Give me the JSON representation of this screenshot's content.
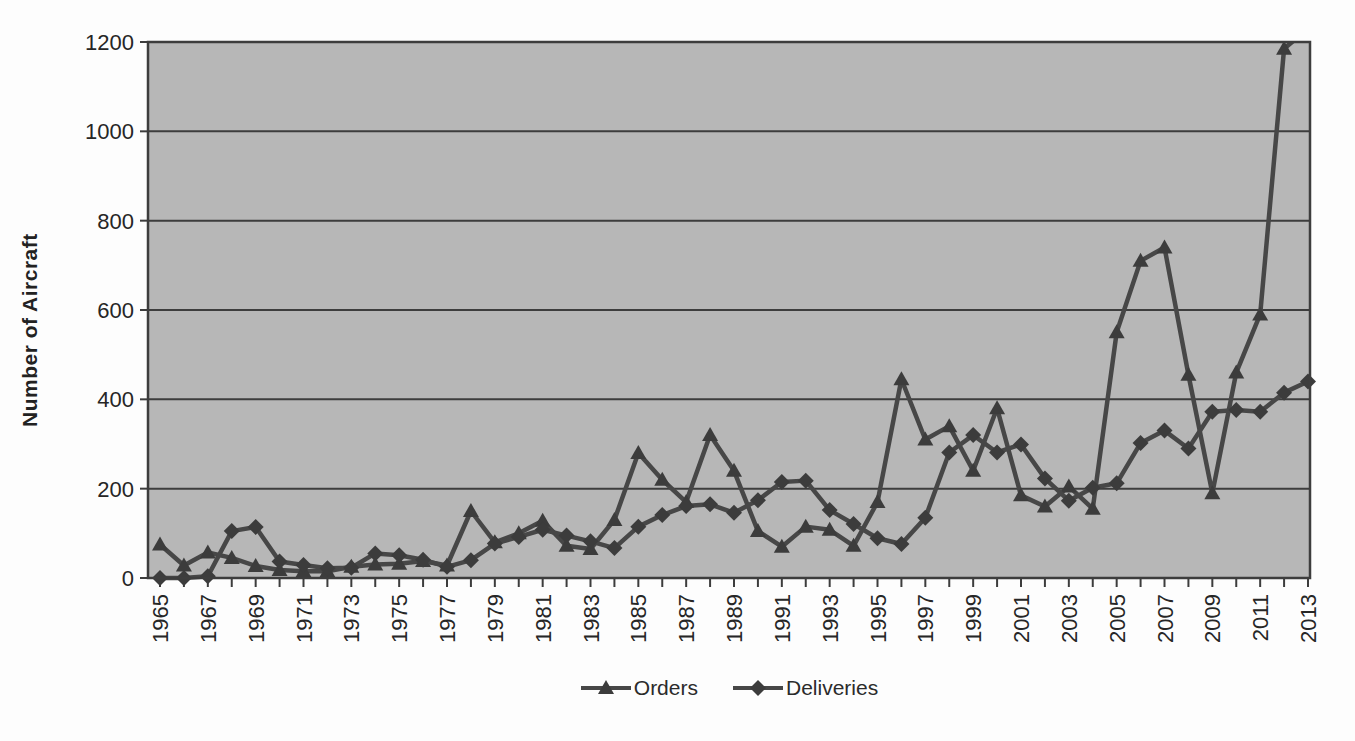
{
  "axis": {
    "y_title": "Number of Aircraft"
  },
  "legend": {
    "items": [
      "Orders",
      "Deliveries"
    ]
  },
  "chart_data": {
    "type": "line",
    "title": "",
    "xlabel": "",
    "ylabel": "Number of Aircraft",
    "ylim": [
      0,
      1200
    ],
    "yticks": [
      0,
      200,
      400,
      600,
      800,
      1000,
      1200
    ],
    "grid": "horizontal",
    "plot_background": "#b7b7b7",
    "line_color": "#474747",
    "marker_color": "#3c3c3c",
    "grid_color": "#3d3d3d",
    "text_color": "#262626",
    "legend_position": "bottom-center",
    "x_label_every": 2,
    "x_labels_rotated_degrees": 90,
    "years": [
      1965,
      1966,
      1967,
      1968,
      1969,
      1970,
      1971,
      1972,
      1973,
      1974,
      1975,
      1976,
      1977,
      1978,
      1979,
      1980,
      1981,
      1982,
      1983,
      1984,
      1985,
      1986,
      1987,
      1988,
      1989,
      1990,
      1991,
      1992,
      1993,
      1994,
      1995,
      1996,
      1997,
      1998,
      1999,
      2000,
      2001,
      2002,
      2003,
      2004,
      2005,
      2006,
      2007,
      2008,
      2009,
      2010,
      2011,
      2012,
      2013
    ],
    "series": [
      {
        "name": "Orders",
        "marker": "triangle",
        "values": [
          75,
          28,
          57,
          45,
          27,
          18,
          15,
          15,
          25,
          30,
          32,
          38,
          28,
          150,
          80,
          100,
          128,
          72,
          65,
          130,
          280,
          220,
          170,
          320,
          240,
          105,
          70,
          115,
          108,
          72,
          170,
          445,
          310,
          340,
          240,
          380,
          185,
          160,
          205,
          155,
          550,
          710,
          740,
          455,
          190,
          460,
          590,
          1185,
          1230
        ],
        "clipped_above_axis_max": [
          2013
        ]
      },
      {
        "name": "Deliveries",
        "marker": "diamond",
        "values": [
          0,
          0,
          4,
          105,
          114,
          37,
          29,
          22,
          23,
          55,
          51,
          41,
          25,
          40,
          77,
          92,
          108,
          95,
          82,
          67,
          115,
          141,
          161,
          165,
          146,
          174,
          215,
          218,
          152,
          121,
          89,
          76,
          135,
          281,
          320,
          281,
          299,
          223,
          173,
          202,
          212,
          302,
          330,
          290,
          372,
          376,
          372,
          415,
          440
        ]
      }
    ]
  }
}
